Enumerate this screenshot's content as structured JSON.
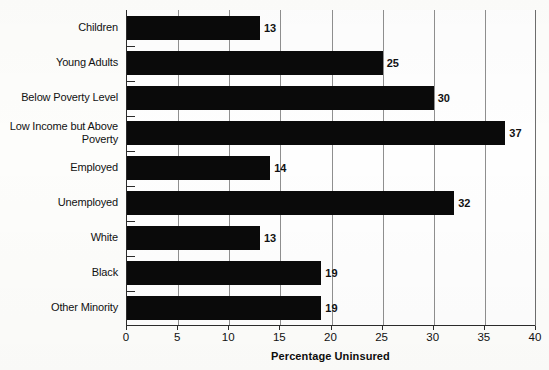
{
  "chart_data": {
    "type": "bar",
    "orientation": "horizontal",
    "title": "",
    "xlabel": "Percentage Uninsured",
    "ylabel": "",
    "xlim": [
      0,
      40
    ],
    "xticks": [
      0,
      5,
      10,
      15,
      20,
      25,
      30,
      35,
      40
    ],
    "grid": true,
    "legend": null,
    "categories": [
      "Children",
      "Young Adults",
      "Below Poverty Level",
      "Low Income but Above\nPoverty",
      "Employed",
      "Unemployed",
      "White",
      "Black",
      "Other Minority"
    ],
    "values": [
      13,
      25,
      30,
      37,
      14,
      32,
      13,
      19,
      19
    ],
    "value_labels": [
      "13",
      "25",
      "30",
      "37",
      "14",
      "32",
      "13",
      "19",
      "19"
    ],
    "colors": {
      "bar": "#0a0a0a",
      "background": "#fdfdfb",
      "gridline": "#8f8f8f",
      "axis": "#2b2b2b",
      "text": "#111111"
    }
  }
}
